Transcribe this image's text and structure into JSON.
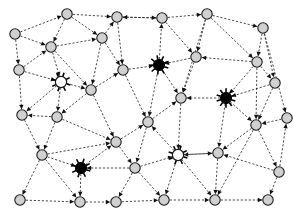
{
  "figure": {
    "background_color": "#ffffff",
    "width": 293,
    "height": 220
  },
  "style": {
    "edge_color": "#2b2b2b",
    "edge_dash": "dashed",
    "arrowhead_color": "#111111",
    "node_grey_fill": "#d0d0d0",
    "node_grey_stroke": "#1a1a1a",
    "node_hollow_fill": "#ffffff",
    "node_black_fill": "#000000",
    "node_radius": 5.2,
    "hub_radius": 5.6
  },
  "legend": {
    "grey_node_label": "ordinary node",
    "hollow_node_label": "hub node",
    "black_node_label": "highlighted node"
  },
  "graph_data": {
    "type": "directed-graph",
    "node_count": 36,
    "edge_count": 86,
    "nodes": [
      {
        "id": "n0",
        "x": 67,
        "y": 14,
        "kind": "grey"
      },
      {
        "id": "n1",
        "x": 117,
        "y": 17,
        "kind": "grey"
      },
      {
        "id": "n2",
        "x": 162,
        "y": 18,
        "kind": "grey"
      },
      {
        "id": "n3",
        "x": 207,
        "y": 14,
        "kind": "grey"
      },
      {
        "id": "n4",
        "x": 263,
        "y": 28,
        "kind": "grey"
      },
      {
        "id": "n5",
        "x": 15,
        "y": 34,
        "kind": "grey"
      },
      {
        "id": "n6",
        "x": 51,
        "y": 47,
        "kind": "grey"
      },
      {
        "id": "n7",
        "x": 102,
        "y": 38,
        "kind": "grey"
      },
      {
        "id": "n8",
        "x": 196,
        "y": 57,
        "kind": "grey"
      },
      {
        "id": "n9",
        "x": 257,
        "y": 62,
        "kind": "grey"
      },
      {
        "id": "n10",
        "x": 19,
        "y": 70,
        "kind": "grey"
      },
      {
        "id": "n11",
        "x": 123,
        "y": 70,
        "kind": "grey"
      },
      {
        "id": "n12",
        "x": 159,
        "y": 65,
        "kind": "black"
      },
      {
        "id": "n13",
        "x": 61,
        "y": 82,
        "kind": "hollow"
      },
      {
        "id": "n14",
        "x": 91,
        "y": 90,
        "kind": "grey"
      },
      {
        "id": "n15",
        "x": 275,
        "y": 83,
        "kind": "grey"
      },
      {
        "id": "n16",
        "x": 226,
        "y": 98,
        "kind": "black"
      },
      {
        "id": "n17",
        "x": 181,
        "y": 98,
        "kind": "grey"
      },
      {
        "id": "n18",
        "x": 22,
        "y": 115,
        "kind": "grey"
      },
      {
        "id": "n19",
        "x": 57,
        "y": 117,
        "kind": "grey"
      },
      {
        "id": "n20",
        "x": 116,
        "y": 142,
        "kind": "grey"
      },
      {
        "id": "n21",
        "x": 148,
        "y": 122,
        "kind": "grey"
      },
      {
        "id": "n22",
        "x": 256,
        "y": 125,
        "kind": "grey"
      },
      {
        "id": "n23",
        "x": 42,
        "y": 155,
        "kind": "grey"
      },
      {
        "id": "n24",
        "x": 81,
        "y": 168,
        "kind": "black"
      },
      {
        "id": "n25",
        "x": 135,
        "y": 168,
        "kind": "grey"
      },
      {
        "id": "n26",
        "x": 178,
        "y": 155,
        "kind": "hollow"
      },
      {
        "id": "n27",
        "x": 218,
        "y": 153,
        "kind": "grey"
      },
      {
        "id": "n28",
        "x": 279,
        "y": 172,
        "kind": "grey"
      },
      {
        "id": "n29",
        "x": 20,
        "y": 200,
        "kind": "grey"
      },
      {
        "id": "n30",
        "x": 80,
        "y": 202,
        "kind": "grey"
      },
      {
        "id": "n31",
        "x": 116,
        "y": 202,
        "kind": "grey"
      },
      {
        "id": "n32",
        "x": 164,
        "y": 200,
        "kind": "grey"
      },
      {
        "id": "n33",
        "x": 215,
        "y": 200,
        "kind": "grey"
      },
      {
        "id": "n34",
        "x": 268,
        "y": 200,
        "kind": "grey"
      },
      {
        "id": "n35",
        "x": 287,
        "y": 118,
        "kind": "grey"
      }
    ],
    "edges": [
      {
        "from": "n5",
        "to": "n0"
      },
      {
        "from": "n0",
        "to": "n1"
      },
      {
        "from": "n2",
        "to": "n1"
      },
      {
        "from": "n2",
        "to": "n3"
      },
      {
        "from": "n3",
        "to": "n4"
      },
      {
        "from": "n0",
        "to": "n6"
      },
      {
        "from": "n5",
        "to": "n6"
      },
      {
        "from": "n6",
        "to": "n7"
      },
      {
        "from": "n0",
        "to": "n7"
      },
      {
        "from": "n7",
        "to": "n1"
      },
      {
        "from": "n1",
        "to": "n11"
      },
      {
        "from": "n2",
        "to": "n8"
      },
      {
        "from": "n3",
        "to": "n8"
      },
      {
        "from": "n3",
        "to": "n9"
      },
      {
        "from": "n4",
        "to": "n9"
      },
      {
        "from": "n5",
        "to": "n10"
      },
      {
        "from": "n6",
        "to": "n13"
      },
      {
        "from": "n7",
        "to": "n11"
      },
      {
        "from": "n11",
        "to": "n12"
      },
      {
        "from": "n12",
        "to": "n2"
      },
      {
        "from": "n8",
        "to": "n12"
      },
      {
        "from": "n9",
        "to": "n8"
      },
      {
        "from": "n9",
        "to": "n15"
      },
      {
        "from": "n4",
        "to": "n15"
      },
      {
        "from": "n10",
        "to": "n13"
      },
      {
        "from": "n10",
        "to": "n6"
      },
      {
        "from": "n13",
        "to": "n14"
      },
      {
        "from": "n14",
        "to": "n11"
      },
      {
        "from": "n12",
        "to": "n17"
      },
      {
        "from": "n8",
        "to": "n17"
      },
      {
        "from": "n9",
        "to": "n16"
      },
      {
        "from": "n16",
        "to": "n17"
      },
      {
        "from": "n15",
        "to": "n16"
      },
      {
        "from": "n15",
        "to": "n22"
      },
      {
        "from": "n10",
        "to": "n18"
      },
      {
        "from": "n13",
        "to": "n18"
      },
      {
        "from": "n13",
        "to": "n19"
      },
      {
        "from": "n19",
        "to": "n18"
      },
      {
        "from": "n14",
        "to": "n19"
      },
      {
        "from": "n14",
        "to": "n20"
      },
      {
        "from": "n11",
        "to": "n21"
      },
      {
        "from": "n21",
        "to": "n17"
      },
      {
        "from": "n17",
        "to": "n26"
      },
      {
        "from": "n16",
        "to": "n22"
      },
      {
        "from": "n22",
        "to": "n28"
      },
      {
        "from": "n18",
        "to": "n23"
      },
      {
        "from": "n19",
        "to": "n23"
      },
      {
        "from": "n23",
        "to": "n20"
      },
      {
        "from": "n20",
        "to": "n21"
      },
      {
        "from": "n21",
        "to": "n25"
      },
      {
        "from": "n26",
        "to": "n21"
      },
      {
        "from": "n22",
        "to": "n27"
      },
      {
        "from": "n27",
        "to": "n26"
      },
      {
        "from": "n28",
        "to": "n27"
      },
      {
        "from": "n23",
        "to": "n24"
      },
      {
        "from": "n23",
        "to": "n29"
      },
      {
        "from": "n20",
        "to": "n25"
      },
      {
        "from": "n25",
        "to": "n24"
      },
      {
        "from": "n25",
        "to": "n26"
      },
      {
        "from": "n26",
        "to": "n27"
      },
      {
        "from": "n29",
        "to": "n30"
      },
      {
        "from": "n24",
        "to": "n30"
      },
      {
        "from": "n23",
        "to": "n30"
      },
      {
        "from": "n25",
        "to": "n31"
      },
      {
        "from": "n30",
        "to": "n31"
      },
      {
        "from": "n26",
        "to": "n32"
      },
      {
        "from": "n25",
        "to": "n32"
      },
      {
        "from": "n31",
        "to": "n32"
      },
      {
        "from": "n27",
        "to": "n33"
      },
      {
        "from": "n32",
        "to": "n33"
      },
      {
        "from": "n33",
        "to": "n34"
      },
      {
        "from": "n28",
        "to": "n34"
      },
      {
        "from": "n22",
        "to": "n33"
      },
      {
        "from": "n35",
        "to": "n22"
      },
      {
        "from": "n4",
        "to": "n35"
      },
      {
        "from": "n26",
        "to": "n33"
      },
      {
        "from": "n24",
        "to": "n20"
      },
      {
        "from": "n12",
        "to": "n21"
      },
      {
        "from": "n1",
        "to": "n2"
      },
      {
        "from": "n7",
        "to": "n14"
      },
      {
        "from": "n6",
        "to": "n14"
      },
      {
        "from": "n19",
        "to": "n20"
      },
      {
        "from": "n28",
        "to": "n35"
      },
      {
        "from": "n16",
        "to": "n27"
      },
      {
        "from": "n9",
        "to": "n22"
      },
      {
        "from": "n3",
        "to": "n17"
      }
    ],
    "burst_nodes": [
      {
        "id": "n12",
        "rays": 9
      },
      {
        "id": "n16",
        "rays": 10
      },
      {
        "id": "n24",
        "rays": 8
      },
      {
        "id": "n13",
        "rays": 8
      },
      {
        "id": "n26",
        "rays": 8
      }
    ]
  }
}
